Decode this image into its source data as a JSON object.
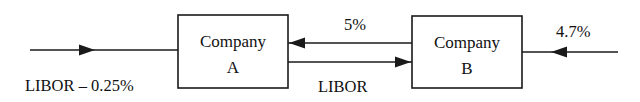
{
  "diagram": {
    "background_color": "#ffffff",
    "line_color": "#1a1a1a",
    "text_color": "#111111",
    "entities": [
      {
        "id": "company-a",
        "line1": "Company",
        "line2": "A",
        "box": {
          "x": 178,
          "y": 15,
          "width": 110,
          "height": 73
        }
      },
      {
        "id": "company-b",
        "line1": "Company",
        "line2": "B",
        "box": {
          "x": 412,
          "y": 16,
          "width": 110,
          "height": 72
        }
      }
    ],
    "flows": [
      {
        "id": "external-inflow-a",
        "label": "LIBOR – 0.25%",
        "direction": "right",
        "from": "external",
        "to": "company-a"
      },
      {
        "id": "fixed-b-to-a",
        "label": "5%",
        "direction": "left",
        "from": "company-b",
        "to": "company-a"
      },
      {
        "id": "floating-a-to-b",
        "label": "LIBOR",
        "direction": "right",
        "from": "company-a",
        "to": "company-b"
      },
      {
        "id": "external-inflow-b",
        "label": "4.7%",
        "direction": "left",
        "from": "external",
        "to": "company-b"
      }
    ]
  }
}
